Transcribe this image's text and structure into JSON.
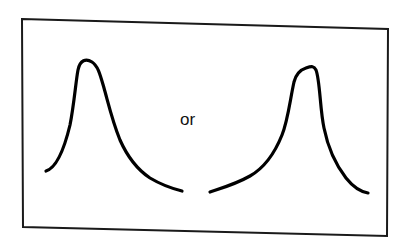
{
  "figure": {
    "frame": {
      "corners": {
        "top_left": [
          22,
          19
        ],
        "top_right": [
          388,
          29
        ],
        "bottom_right": [
          387,
          236
        ],
        "bottom_left": [
          23,
          227
        ]
      },
      "color": "#1a1a1a"
    },
    "connector_text": "or",
    "curves": [
      {
        "id": "left",
        "label": "right-skewed peak (long tail to the right)",
        "skew": "positive",
        "color": "#000000",
        "path": "M46,171 C56,168 64,150 70,125 C74,105 76,80 78,70 C80,60 86,58 92,62 C98,66 100,74 104,88 C108,102 112,120 120,140 C128,158 138,170 150,178 C160,184 170,188 182,191"
      },
      {
        "id": "right",
        "label": "left-skewed peak (long tail to the left)",
        "skew": "negative",
        "color": "#000000",
        "path": "M210,192 C222,188 236,184 250,176 C264,168 274,155 282,135 C288,120 290,100 294,82 C296,74 300,70 306,68 C312,66 314,66 316,70 C320,80 320,110 324,128 C328,148 336,165 346,178 C354,188 362,192 368,193"
      }
    ]
  }
}
